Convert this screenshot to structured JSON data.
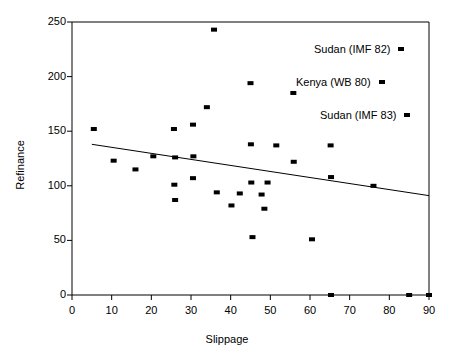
{
  "chart_data": {
    "type": "scatter",
    "title": "",
    "xlabel": "Slippage",
    "ylabel": "Refinance",
    "xlim": [
      0,
      90
    ],
    "ylim": [
      0,
      250
    ],
    "xticks": [
      0,
      10,
      20,
      30,
      40,
      50,
      60,
      70,
      80,
      90
    ],
    "yticks": [
      0,
      50,
      100,
      150,
      200,
      250
    ],
    "grid": false,
    "legend": "none",
    "marker": {
      "shape": "square",
      "color": "#000000",
      "width": 6,
      "height": 4
    },
    "points": [
      {
        "x": 5.5,
        "y": 152
      },
      {
        "x": 10.5,
        "y": 123
      },
      {
        "x": 16.0,
        "y": 115
      },
      {
        "x": 20.5,
        "y": 127
      },
      {
        "x": 25.7,
        "y": 152
      },
      {
        "x": 26.0,
        "y": 126
      },
      {
        "x": 25.8,
        "y": 101
      },
      {
        "x": 26.0,
        "y": 87
      },
      {
        "x": 30.5,
        "y": 156
      },
      {
        "x": 30.6,
        "y": 127
      },
      {
        "x": 30.5,
        "y": 107
      },
      {
        "x": 34.0,
        "y": 172
      },
      {
        "x": 35.8,
        "y": 243
      },
      {
        "x": 36.5,
        "y": 94
      },
      {
        "x": 40.2,
        "y": 82
      },
      {
        "x": 42.3,
        "y": 93
      },
      {
        "x": 45.0,
        "y": 194
      },
      {
        "x": 45.1,
        "y": 138
      },
      {
        "x": 45.2,
        "y": 103
      },
      {
        "x": 45.5,
        "y": 53
      },
      {
        "x": 47.8,
        "y": 92
      },
      {
        "x": 48.5,
        "y": 79
      },
      {
        "x": 49.3,
        "y": 103
      },
      {
        "x": 51.5,
        "y": 137
      },
      {
        "x": 55.8,
        "y": 185
      },
      {
        "x": 55.9,
        "y": 122
      },
      {
        "x": 60.5,
        "y": 51
      },
      {
        "x": 65.2,
        "y": 137
      },
      {
        "x": 65.3,
        "y": 108
      },
      {
        "x": 65.3,
        "y": 0
      },
      {
        "x": 76.0,
        "y": 100
      },
      {
        "x": 85.0,
        "y": 0
      },
      {
        "x": 90.0,
        "y": 0
      }
    ],
    "trendline": {
      "type": "linear-fit",
      "x_start": 5.0,
      "y_start": 138,
      "x_end": 90.0,
      "y_end": 91
    },
    "annotations": [
      {
        "label": "Sudan (IMF 82)",
        "marker": true
      },
      {
        "label": "Kenya (WB 80)",
        "marker": true
      },
      {
        "label": "Sudan (IMF 83)",
        "marker": true
      }
    ]
  },
  "axes": {
    "x_title": "Slippage",
    "y_title": "Refinance",
    "x_tick_labels": [
      "0",
      "10",
      "20",
      "30",
      "40",
      "50",
      "60",
      "70",
      "80",
      "90"
    ],
    "y_tick_labels": [
      "0",
      "50",
      "100",
      "150",
      "200",
      "250"
    ]
  },
  "annotations": {
    "a0": "Sudan (IMF 82)",
    "a1": "Kenya (WB 80)",
    "a2": "Sudan (IMF 83)"
  }
}
